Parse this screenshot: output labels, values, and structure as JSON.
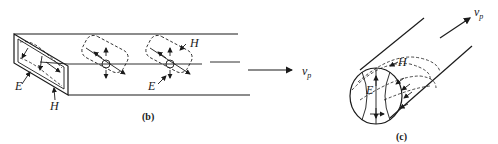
{
  "figure_b": {
    "caption": "(b)",
    "labels": {
      "e_field": "E",
      "h_field": "H",
      "h_field_2": "H",
      "velocity": "v",
      "velocity_sub": "p"
    },
    "description": "Rectangular waveguide with E and H field patterns propagating along the guide"
  },
  "figure_c": {
    "caption": "(c)",
    "labels": {
      "e_field": "E",
      "h_field": "H",
      "velocity": "v",
      "velocity_sub": "p"
    },
    "description": "Circular waveguide with E and H field patterns"
  }
}
